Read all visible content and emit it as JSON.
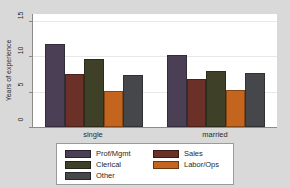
{
  "chart_data": {
    "type": "bar",
    "title": "",
    "subtitle": "",
    "xlabel": "",
    "ylabel": "Years of experience",
    "categories": [
      "single",
      "married"
    ],
    "ylim": [
      0,
      16
    ],
    "yticks": [
      0,
      5,
      10,
      15
    ],
    "ytick_labels": [
      "0",
      "5",
      "10",
      "15"
    ],
    "grid": true,
    "legend_position": "bottom",
    "series": [
      {
        "name": "Prof/Mgmt",
        "color": "#4a3f55",
        "values": [
          11.8,
          10.2
        ]
      },
      {
        "name": "Sales",
        "color": "#6b3028",
        "values": [
          7.5,
          6.8
        ]
      },
      {
        "name": "Clerical",
        "color": "#3e4028",
        "values": [
          9.7,
          8.0
        ]
      },
      {
        "name": "Labor/Ops",
        "color": "#c4651f",
        "values": [
          5.1,
          5.2
        ]
      },
      {
        "name": "Other",
        "color": "#45474a",
        "values": [
          7.3,
          7.7
        ]
      }
    ]
  },
  "legend": {
    "entries": [
      {
        "label": "Prof/Mgmt",
        "color": "#4a3f55"
      },
      {
        "label": "Sales",
        "color": "#6b3028"
      },
      {
        "label": "Clerical",
        "color": "#3e4028"
      },
      {
        "label": "Labor/Ops",
        "color": "#c4651f"
      },
      {
        "label": "Other",
        "color": "#45474a"
      }
    ]
  },
  "colors": {
    "page_background": "#d9d9d9",
    "plot_background": "#ffffff",
    "axis": "#8a8a8a",
    "grid": "#e8e8e8",
    "text": "#2b2b2b"
  }
}
